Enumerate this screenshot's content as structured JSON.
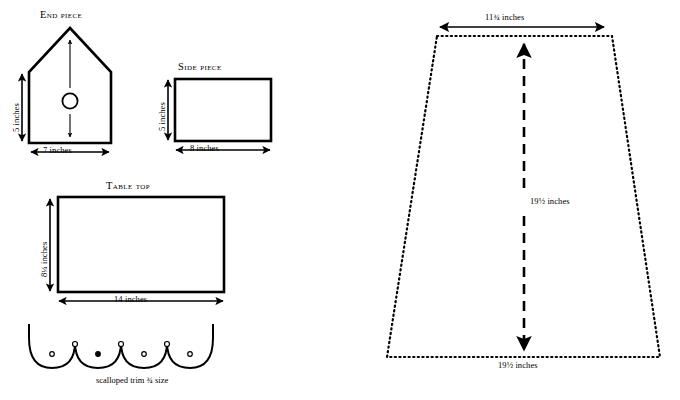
{
  "document": {
    "kind": "woodworking-pattern-diagram",
    "background_color": "#ffffff",
    "ink_color": "#000000"
  },
  "pieces": {
    "end_piece": {
      "title": "End piece",
      "width_label": "7 inches",
      "height_label": "5 inches",
      "hole": "entry-hole"
    },
    "side_piece": {
      "title": "Side piece",
      "width_label": "8 inches",
      "height_label": "5 inches"
    },
    "table_top": {
      "title": "Table top",
      "width_label": "14 inches",
      "height_label": "8¼ inches"
    },
    "scalloped_trim": {
      "caption": "scalloped trim ¾ size"
    },
    "skirt_panel": {
      "top_label": "11¾ inches",
      "center_label": "19½ inches",
      "bottom_label": "19½ inches"
    }
  }
}
